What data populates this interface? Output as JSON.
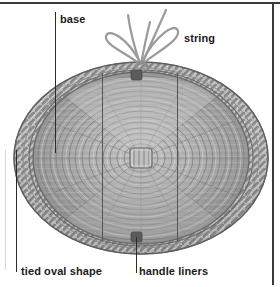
{
  "figure": {
    "background_color": "#ffffff",
    "frame_color": "#3a3a3a",
    "basket_colors": {
      "rim_light": "#d2d2d2",
      "rim_mid": "#a8a8a8",
      "rim_dark": "#6f6f6f",
      "weave_light": "#cfcfcf",
      "weave_mid": "#9e9e9e",
      "weave_dark": "#767676",
      "knot_dark": "#5b5b5b",
      "string_gray": "#9a9a9a"
    },
    "leader_line_color": "#2b2b2b",
    "liner_rule_color": "#53555a"
  },
  "labels": {
    "base": "base",
    "string": "string",
    "tied_oval_shape": "tied oval shape",
    "handle_liners": "handle liners"
  },
  "annotations": [
    {
      "name": "base",
      "text": "base",
      "leader": "vertical line down to basket weave base"
    },
    {
      "name": "string",
      "text": "string",
      "leader": "points to bow knot at top of basket"
    },
    {
      "name": "tied-oval-shape",
      "text": "tied oval shape",
      "leader": "vertical line up to basket rim at left"
    },
    {
      "name": "handle-liners",
      "text": "handle liners",
      "leader": "vertical line up to dark knot at bottom of basket"
    }
  ]
}
